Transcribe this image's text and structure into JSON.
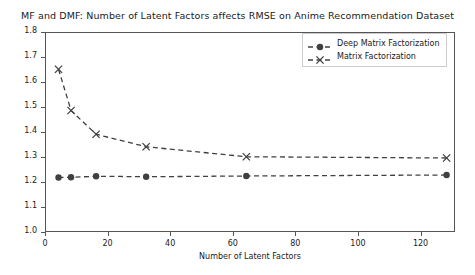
{
  "chart_data": {
    "type": "line",
    "title": "MF and DMF: Number of Latent Factors affects RMSE on Anime Recommendation Dataset",
    "xlabel": "Number of Latent Factors",
    "ylabel": "RMSE",
    "xlim": [
      0,
      131
    ],
    "ylim": [
      1.0,
      1.8
    ],
    "xticks": [
      0,
      20,
      40,
      60,
      80,
      100,
      120
    ],
    "yticks": [
      "1.0",
      "1.1",
      "1.2",
      "1.3",
      "1.4",
      "1.5",
      "1.6",
      "1.7",
      "1.8"
    ],
    "ytick_values": [
      1.0,
      1.1,
      1.2,
      1.3,
      1.4,
      1.5,
      1.6,
      1.7,
      1.8
    ],
    "grid": false,
    "legend_position": "upper right",
    "x": [
      4,
      8,
      16,
      32,
      64,
      128
    ],
    "series": [
      {
        "name": "Deep Matrix Factorization",
        "marker": "circle",
        "linestyle": "dashed",
        "color": "#404040",
        "values": [
          1.222,
          1.223,
          1.227,
          1.225,
          1.228,
          1.232
        ]
      },
      {
        "name": "Matrix Factorization",
        "marker": "x",
        "linestyle": "dashed",
        "color": "#404040",
        "values": [
          1.655,
          1.49,
          1.395,
          1.345,
          1.305,
          1.3
        ]
      }
    ]
  },
  "legend": {
    "entries": [
      {
        "label": "Deep Matrix Factorization",
        "marker": "circle-marker-icon"
      },
      {
        "label": "Matrix Factorization",
        "marker": "x-marker-icon"
      }
    ]
  },
  "colors": {
    "line": "#404040",
    "axis": "#555555",
    "text": "#1a1a1a",
    "background": "#ffffff"
  }
}
